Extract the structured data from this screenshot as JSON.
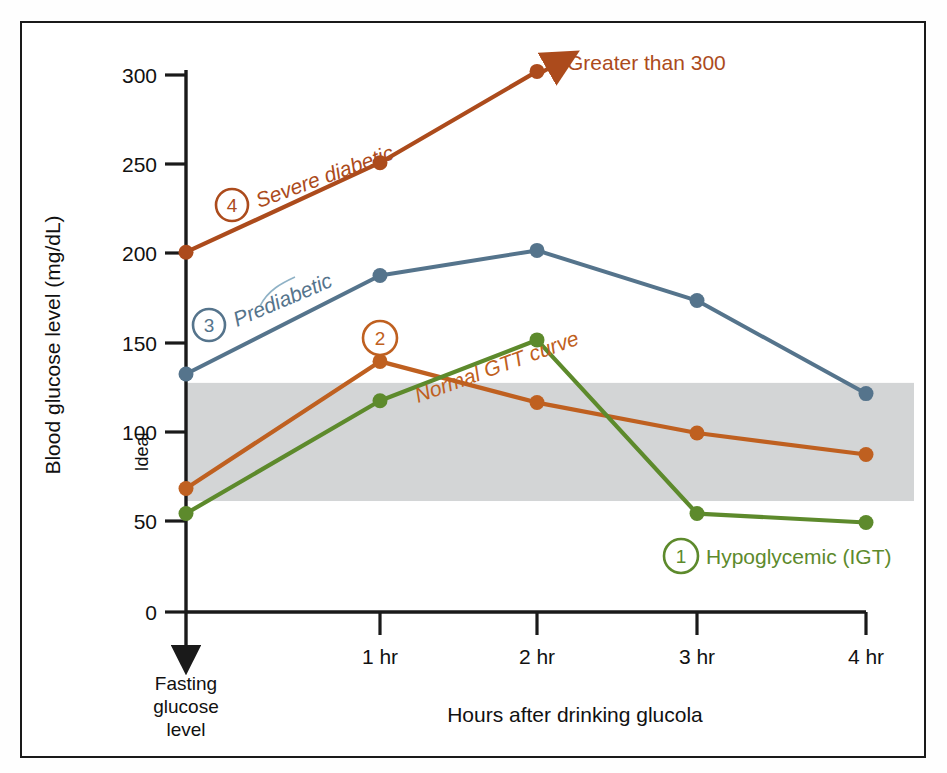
{
  "figure": {
    "background": "#ffffff",
    "border_color": "#1a1a1a"
  },
  "axes": {
    "ylabel": "Blood glucose level (mg/dL)",
    "xlabel": "Hours after drinking glucola",
    "y_ticks": [
      "0",
      "50",
      "100",
      "150",
      "200",
      "250",
      "300"
    ],
    "x_ticks": [
      "1 hr",
      "2 hr",
      "3 hr",
      "4 hr"
    ],
    "origin_label_line1": "Fasting",
    "origin_label_line2": "glucose",
    "origin_label_line3": "level",
    "band_label": "Ideal",
    "band_color": "#d3d5d6"
  },
  "annotations": {
    "greater_than_300": "Greater than 300"
  },
  "legend": {
    "items": [
      {
        "num": "1",
        "label": "Hypoglycemic (IGT)",
        "color": "#5d8a2c"
      },
      {
        "num": "2",
        "label": "Normal GTT curve",
        "color": "#bf6020"
      },
      {
        "num": "3",
        "label": "Prediabetic",
        "color": "#55748c"
      },
      {
        "num": "4",
        "label": "Severe diabetic",
        "color": "#ac4b1c"
      }
    ]
  },
  "chart_data": {
    "type": "line",
    "title": "",
    "xlabel": "Hours after drinking glucola",
    "ylabel": "Blood glucose level (mg/dL)",
    "x": [
      "Fasting glucose level",
      "1 hr",
      "2 hr",
      "3 hr",
      "4 hr"
    ],
    "xlim": [
      0,
      4.35
    ],
    "ylim": [
      0,
      315
    ],
    "ytick_values": [
      0,
      50,
      100,
      150,
      200,
      250,
      300
    ],
    "grid": false,
    "legend_position": "inline-annotations",
    "shaded_band": {
      "name": "Ideal",
      "ymin": 62,
      "ymax": 128,
      "color": "#d3d5d6"
    },
    "series": [
      {
        "name": "Hypoglycemic (IGT)",
        "number": "1",
        "color": "#5d8a2c",
        "values": [
          55,
          118,
          152,
          55,
          50
        ]
      },
      {
        "name": "Normal GTT curve",
        "number": "2",
        "color": "#bf6020",
        "values": [
          69,
          140,
          117,
          100,
          88
        ]
      },
      {
        "name": "Prediabetic",
        "number": "3",
        "color": "#55748c",
        "values": [
          133,
          188,
          202,
          174,
          122
        ]
      },
      {
        "name": "Severe diabetic",
        "number": "4",
        "color": "#ac4b1c",
        "values": [
          201,
          251,
          302,
          null,
          null
        ],
        "note": "Greater than 300",
        "arrow_end": true
      }
    ]
  }
}
